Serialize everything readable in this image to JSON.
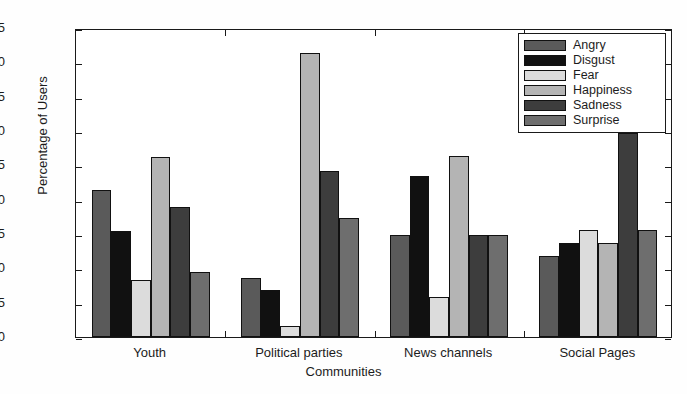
{
  "chart_data": {
    "type": "bar",
    "title": "",
    "xlabel": "Communities",
    "ylabel": "Percentage of Users",
    "categories": [
      "Youth",
      "Political parties",
      "News channels",
      "Social Pages"
    ],
    "ylim": [
      0,
      45
    ],
    "yticks": [
      0,
      5,
      10,
      15,
      20,
      25,
      30,
      35,
      40,
      45
    ],
    "grid": false,
    "legend_position": "top-right",
    "series": [
      {
        "name": "Angry",
        "color": "#5a5a5a",
        "values": [
          21.4,
          8.6,
          14.8,
          11.8
        ]
      },
      {
        "name": "Disgust",
        "color": "#111111",
        "values": [
          15.4,
          6.8,
          23.5,
          13.7
        ]
      },
      {
        "name": "Fear",
        "color": "#dcdcdc",
        "values": [
          8.3,
          1.6,
          5.9,
          15.6
        ]
      },
      {
        "name": "Happiness",
        "color": "#b4b4b4",
        "values": [
          26.2,
          41.4,
          26.4,
          13.7
        ]
      },
      {
        "name": "Sadness",
        "color": "#3d3d3d",
        "values": [
          19.0,
          24.2,
          14.8,
          29.7
        ]
      },
      {
        "name": "Surprise",
        "color": "#6e6e6e",
        "values": [
          9.5,
          17.3,
          14.8,
          15.6
        ]
      }
    ]
  },
  "axis": {
    "ylabel": "Percentage of Users",
    "xlabel": "Communities",
    "ytick_labels": [
      "0",
      "5",
      "10",
      "15",
      "20",
      "25",
      "30",
      "35",
      "40",
      "45"
    ],
    "xtick_labels": [
      "Youth",
      "Political parties",
      "News channels",
      "Social Pages"
    ]
  },
  "legend": {
    "items": [
      {
        "label": "Angry"
      },
      {
        "label": "Disgust"
      },
      {
        "label": "Fear"
      },
      {
        "label": "Happiness"
      },
      {
        "label": "Sadness"
      },
      {
        "label": "Surprise"
      }
    ]
  }
}
